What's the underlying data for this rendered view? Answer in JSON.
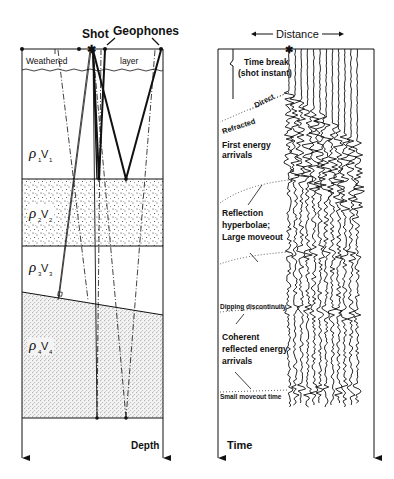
{
  "left_panel": {
    "title_labels": {
      "shot": "Shot",
      "geophones": "Geophones"
    },
    "weathered_layer": {
      "left": "Weathered",
      "right": "layer"
    },
    "layers": [
      {
        "rho": "ρ",
        "sub_rho": "1",
        "v": "V",
        "sub_v": "1",
        "fill": "blank"
      },
      {
        "rho": "ρ",
        "sub_rho": "2",
        "v": "V",
        "sub_v": "2",
        "fill": "stippled"
      },
      {
        "rho": "ρ",
        "sub_rho": "3",
        "v": "V",
        "sub_v": "3",
        "fill": "blank"
      },
      {
        "rho": "ρ",
        "sub_rho": "4",
        "v": "V",
        "sub_v": "4",
        "fill": "stippled-dense"
      }
    ],
    "axis_label": "Depth"
  },
  "right_panel": {
    "axis_top_label": "Distance",
    "axis_label": "Time",
    "annotations": {
      "time_break": "Time break",
      "shot_instant": "(shot instant)",
      "direct": "Direct",
      "refracted": "Refracted",
      "first_energy_1": "First energy",
      "first_energy_2": "arrivals",
      "reflection_1": "Reflection",
      "reflection_2": "hyperbolae;",
      "reflection_3": "Large moveout",
      "dipping": "Dipping discontinuity",
      "coherent_1": "Coherent",
      "coherent_2": "reflected energy",
      "coherent_3": "arrivals",
      "small_moveout": "Small moveout time"
    },
    "trace_count": 12
  },
  "colors": {
    "ink": "#111111",
    "paper": "#ffffff"
  }
}
